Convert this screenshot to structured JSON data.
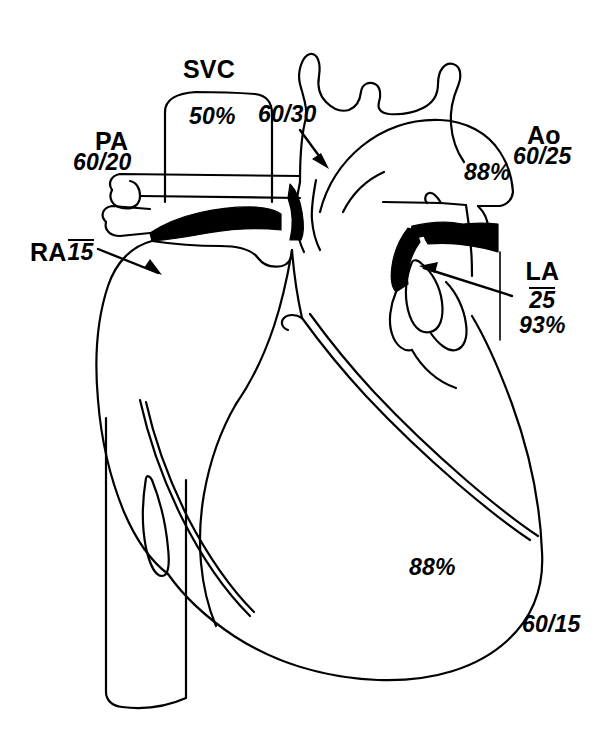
{
  "figure": {
    "type": "anatomical-line-diagram",
    "background_color": "#ffffff",
    "line_color": "#000000",
    "fill_color": "#000000"
  },
  "annotations": {
    "svc": {
      "name": "SVC",
      "saturation": "50%"
    },
    "pa": {
      "name": "PA",
      "pressure": "60/20"
    },
    "pa_branch": {
      "pressure": "60/30"
    },
    "ao": {
      "name": "Ao",
      "pressure": "60/25",
      "saturation": "88%"
    },
    "ra": {
      "name": "RA",
      "mean_pressure": "15"
    },
    "la": {
      "name": "LA",
      "mean_pressure": "25",
      "saturation": "93%"
    },
    "lv": {
      "saturation": "88%",
      "pressure": "60/15"
    }
  }
}
